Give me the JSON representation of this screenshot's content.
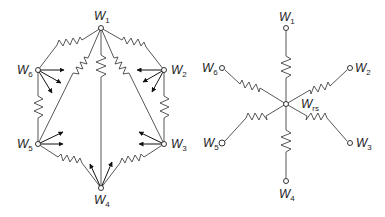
{
  "figure": {
    "left_network": {
      "description": "fully connected mesh of six nodes with resistors",
      "nodes": [
        {
          "id": "W1",
          "base": "W",
          "sub": "1",
          "x": 101,
          "y": 28
        },
        {
          "id": "W2",
          "base": "W",
          "sub": "2",
          "x": 164,
          "y": 70
        },
        {
          "id": "W3",
          "base": "W",
          "sub": "3",
          "x": 164,
          "y": 144
        },
        {
          "id": "W4",
          "base": "W",
          "sub": "4",
          "x": 101,
          "y": 188
        },
        {
          "id": "W5",
          "base": "W",
          "sub": "5",
          "x": 38,
          "y": 144
        },
        {
          "id": "W6",
          "base": "W",
          "sub": "6",
          "x": 38,
          "y": 70
        }
      ]
    },
    "right_network": {
      "description": "star network with central node",
      "center": {
        "id": "Wrs",
        "base": "W",
        "sub": "rs",
        "x": 286,
        "y": 104
      },
      "nodes": [
        {
          "id": "W1",
          "base": "W",
          "sub": "1",
          "x": 286,
          "y": 28
        },
        {
          "id": "W2",
          "base": "W",
          "sub": "2",
          "x": 350,
          "y": 68
        },
        {
          "id": "W3",
          "base": "W",
          "sub": "3",
          "x": 350,
          "y": 143
        },
        {
          "id": "W4",
          "base": "W",
          "sub": "4",
          "x": 286,
          "y": 181
        },
        {
          "id": "W5",
          "base": "W",
          "sub": "5",
          "x": 222,
          "y": 143
        },
        {
          "id": "W6",
          "base": "W",
          "sub": "6",
          "x": 222,
          "y": 68
        }
      ]
    }
  }
}
